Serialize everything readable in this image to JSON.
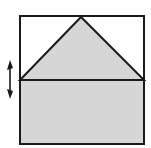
{
  "diagram": {
    "colors": {
      "stroke": "#1a1a1a",
      "fill_shaded": "#d6d6d6",
      "background": "#ffffff"
    },
    "shapes": {
      "outer_square": {
        "x": 20,
        "y": 16,
        "w": 124,
        "h": 128
      },
      "triangle": {
        "points": "20,80 81,17 144,80"
      },
      "rectangle": {
        "x": 20,
        "y": 80,
        "w": 124,
        "h": 64
      },
      "arrow": {
        "x": 10,
        "y1": 61,
        "y2": 98,
        "direction": "up-down"
      }
    }
  }
}
